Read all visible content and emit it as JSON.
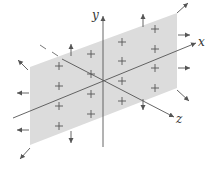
{
  "diagram": {
    "colors": {
      "plane_fill": "#dcdcdc",
      "axis": "#555555",
      "arrow": "#555555",
      "charge": "#555555"
    },
    "axes": {
      "x": {
        "label": "x"
      },
      "y": {
        "label": "y"
      },
      "z": {
        "label": "z"
      }
    },
    "charge_symbol": "+",
    "charges": [
      {
        "x": 59,
        "y": 66
      },
      {
        "x": 91,
        "y": 54
      },
      {
        "x": 122,
        "y": 42
      },
      {
        "x": 155,
        "y": 29
      },
      {
        "x": 59,
        "y": 86
      },
      {
        "x": 91,
        "y": 74
      },
      {
        "x": 122,
        "y": 61
      },
      {
        "x": 155,
        "y": 49
      },
      {
        "x": 59,
        "y": 106
      },
      {
        "x": 91,
        "y": 94
      },
      {
        "x": 122,
        "y": 81
      },
      {
        "x": 155,
        "y": 68
      },
      {
        "x": 59,
        "y": 126
      },
      {
        "x": 91,
        "y": 114
      },
      {
        "x": 122,
        "y": 101
      },
      {
        "x": 155,
        "y": 88
      }
    ],
    "field_arrows": [
      {
        "name": "top-left-corner-arrow",
        "x1": 28,
        "y1": 70,
        "x2": 18,
        "y2": 60
      },
      {
        "name": "up-arrow-left",
        "x1": 71,
        "y1": 56,
        "x2": 71,
        "y2": 44
      },
      {
        "name": "up-arrow-right",
        "x1": 143,
        "y1": 27,
        "x2": 143,
        "y2": 14
      },
      {
        "name": "top-right-corner-arrow",
        "x1": 177,
        "y1": 13,
        "x2": 188,
        "y2": 3
      },
      {
        "name": "right-arrow-top",
        "x1": 178,
        "y1": 35,
        "x2": 190,
        "y2": 35
      },
      {
        "name": "right-arrow-middle",
        "x1": 178,
        "y1": 68,
        "x2": 190,
        "y2": 68
      },
      {
        "name": "bottom-right-corner-arrow",
        "x1": 177,
        "y1": 90,
        "x2": 189,
        "y2": 101
      },
      {
        "name": "down-arrow-right",
        "x1": 143,
        "y1": 99,
        "x2": 143,
        "y2": 110
      },
      {
        "name": "down-arrow-left",
        "x1": 71,
        "y1": 131,
        "x2": 71,
        "y2": 143
      },
      {
        "name": "left-arrow-upper",
        "x1": 29,
        "y1": 93,
        "x2": 17,
        "y2": 93
      },
      {
        "name": "left-arrow-lower",
        "x1": 29,
        "y1": 130,
        "x2": 17,
        "y2": 130
      },
      {
        "name": "bottom-left-corner-arrow",
        "x1": 30,
        "y1": 148,
        "x2": 20,
        "y2": 159
      }
    ]
  }
}
